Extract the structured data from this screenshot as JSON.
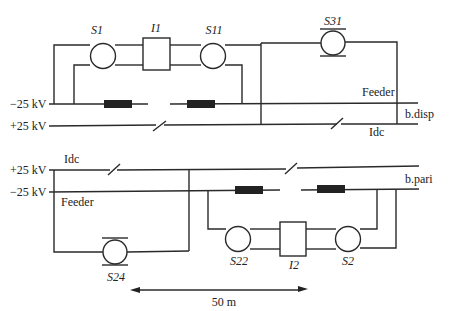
{
  "diagram": {
    "top_section": {
      "rail_negative_label": "−25 kV",
      "rail_positive_label": "+25 kV",
      "feeder_label": "Feeder",
      "idc_label": "Idc",
      "bus_label": "b.disp",
      "switches": [
        "S1",
        "S11",
        "S31"
      ],
      "interrupter": "I1"
    },
    "bottom_section": {
      "rail_positive_label": "+25 kV",
      "rail_negative_label": "−25 kV",
      "feeder_label": "Feeder",
      "idc_label": "Idc",
      "bus_label": "b.pari",
      "switches": [
        "S24",
        "S22",
        "S2"
      ],
      "interrupter": "I2"
    },
    "scale_label": "50 m"
  }
}
